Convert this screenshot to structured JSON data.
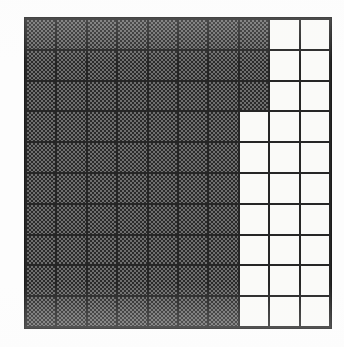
{
  "figure": {
    "kind": "shaded-fraction-grid",
    "title": "",
    "rows": 10,
    "columns": 10,
    "total_cells": 100,
    "shaded_cells": 73,
    "unshaded_cells": 27,
    "fraction_shaded": "73/100",
    "percent_shaded": "73%",
    "decimal_shaded": "0.73"
  },
  "colors": {
    "gridline": "#262626",
    "border": "#1c1c1c",
    "shaded_dark": "#2a2a2a",
    "shaded_light": "#6e6e6e",
    "unshaded": "#fafaf8",
    "background": "#fdfdfd"
  },
  "chart_data": {
    "type": "heatmap",
    "title": "",
    "xlabel": "",
    "ylabel": "",
    "rows": 10,
    "columns": 10,
    "legend": [
      {
        "key": "1",
        "label": "shaded"
      },
      {
        "key": "0",
        "label": "unshaded"
      }
    ],
    "shaded_per_row": [
      8,
      8,
      8,
      7,
      7,
      7,
      7,
      7,
      7,
      7
    ],
    "matrix": [
      [
        1,
        1,
        1,
        1,
        1,
        1,
        1,
        1,
        0,
        0
      ],
      [
        1,
        1,
        1,
        1,
        1,
        1,
        1,
        1,
        0,
        0
      ],
      [
        1,
        1,
        1,
        1,
        1,
        1,
        1,
        1,
        0,
        0
      ],
      [
        1,
        1,
        1,
        1,
        1,
        1,
        1,
        0,
        0,
        0
      ],
      [
        1,
        1,
        1,
        1,
        1,
        1,
        1,
        0,
        0,
        0
      ],
      [
        1,
        1,
        1,
        1,
        1,
        1,
        1,
        0,
        0,
        0
      ],
      [
        1,
        1,
        1,
        1,
        1,
        1,
        1,
        0,
        0,
        0
      ],
      [
        1,
        1,
        1,
        1,
        1,
        1,
        1,
        0,
        0,
        0
      ],
      [
        1,
        1,
        1,
        1,
        1,
        1,
        1,
        0,
        0,
        0
      ],
      [
        1,
        1,
        1,
        1,
        1,
        1,
        1,
        0,
        0,
        0
      ]
    ]
  }
}
